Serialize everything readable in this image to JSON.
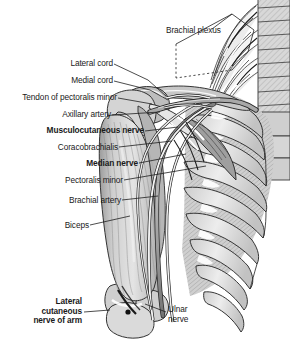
{
  "figure": {
    "background_color": "#ffffff",
    "text_color": "#1a1a1a",
    "line_color": "#2a2a2a",
    "width": 290,
    "height": 344
  },
  "labels": [
    {
      "id": "brachial-plexus",
      "text": "Brachial plexus",
      "bold": false,
      "align": "left",
      "lines": [
        "Brachial plexus"
      ]
    },
    {
      "id": "lateral-cord",
      "text": "Lateral cord",
      "bold": false,
      "align": "right",
      "lines": [
        "Lateral cord"
      ]
    },
    {
      "id": "medial-cord",
      "text": "Medial cord",
      "bold": false,
      "align": "right",
      "lines": [
        "Medial cord"
      ]
    },
    {
      "id": "tendon-of-pectoralis-minor",
      "text": "Tendon of pectoralis minor",
      "bold": false,
      "align": "right",
      "lines": [
        "Tendon of pectoralis minor"
      ]
    },
    {
      "id": "axillary-artery",
      "text": "Axillary artery",
      "bold": false,
      "align": "right",
      "lines": [
        "Axillary artery"
      ]
    },
    {
      "id": "musculocutaneous-nerve",
      "text": "Musculocutaneous nerve",
      "bold": true,
      "align": "right",
      "lines": [
        "Musculocutaneous nerve"
      ]
    },
    {
      "id": "coracobrachialis",
      "text": "Coracobrachialis",
      "bold": false,
      "align": "right",
      "lines": [
        "Coracobrachialis"
      ]
    },
    {
      "id": "median-nerve",
      "text": "Median nerve",
      "bold": true,
      "align": "right",
      "lines": [
        "Median nerve"
      ]
    },
    {
      "id": "pectoralis-minor",
      "text": "Pectoralis minor",
      "bold": false,
      "align": "right",
      "lines": [
        "Pectoralis minor"
      ]
    },
    {
      "id": "brachial-artery",
      "text": "Brachial artery",
      "bold": false,
      "align": "right",
      "lines": [
        "Brachial artery"
      ]
    },
    {
      "id": "biceps",
      "text": "Biceps",
      "bold": false,
      "align": "right",
      "lines": [
        "Biceps"
      ]
    },
    {
      "id": "lateral-cutaneous-nerve-of-arm",
      "text": "Lateral cutaneous nerve of arm",
      "bold": true,
      "align": "right",
      "lines": [
        "Lateral",
        "cutaneous",
        "nerve of arm"
      ]
    },
    {
      "id": "ulnar-nerve",
      "text": "Ulnar nerve",
      "bold": false,
      "align": "left",
      "lines": [
        "Ulnar",
        "nerve"
      ]
    }
  ],
  "label_text": {
    "brachial_plexus": "Brachial plexus",
    "lateral_cord": "Lateral cord",
    "medial_cord": "Medial cord",
    "tendon_of_pectoralis_minor": "Tendon of pectoralis minor",
    "axillary_artery": "Axillary artery",
    "musculocutaneous_nerve": "Musculocutaneous nerve",
    "coracobrachialis": "Coracobrachialis",
    "median_nerve": "Median nerve",
    "pectoralis_minor": "Pectoralis minor",
    "brachial_artery": "Brachial artery",
    "biceps": "Biceps",
    "lat_cut_l1": "Lateral",
    "lat_cut_l2": "cutaneous",
    "lat_cut_l3": "nerve of arm",
    "ulnar_l1": "Ulnar",
    "ulnar_l2": "nerve"
  },
  "structures": [
    {
      "id": "vertebral-column",
      "name": "Vertebral column",
      "tone": "#d2d2d2"
    },
    {
      "id": "rib-cage",
      "name": "Rib cage",
      "tone": "#dcdcdc"
    },
    {
      "id": "intercostal-muscles",
      "name": "Intercostal muscles",
      "tone": "#c4c4c4"
    },
    {
      "id": "clavicle",
      "name": "Clavicle",
      "tone": "#c9c9c9"
    },
    {
      "id": "scapula-coracoid",
      "name": "Coracoid process",
      "tone": "#b9b9b9"
    },
    {
      "id": "humerus",
      "name": "Humerus",
      "tone": "#d6d6d6"
    },
    {
      "id": "biceps-muscle",
      "name": "Biceps brachii",
      "tone": "#c8c8c8"
    },
    {
      "id": "coracobrachialis-muscle",
      "name": "Coracobrachialis",
      "tone": "#bcbcbc"
    },
    {
      "id": "pectoralis-minor-muscle",
      "name": "Pectoralis minor",
      "tone": "#b4b4b4"
    },
    {
      "id": "nerve-bundle",
      "name": "Brachial plexus nerves",
      "tone": "#ffffff"
    },
    {
      "id": "artery",
      "name": "Axillary / brachial artery",
      "tone": "#9a9a9a"
    }
  ]
}
